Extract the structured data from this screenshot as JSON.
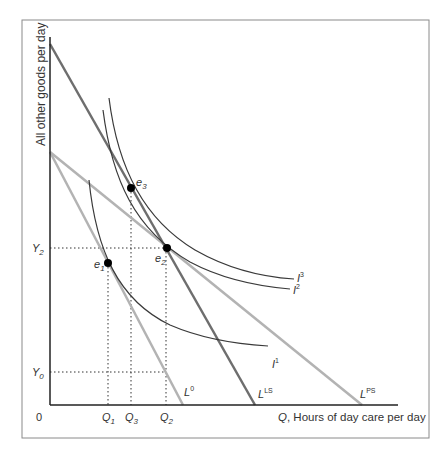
{
  "diagram": {
    "type": "indifference-curve budget-line diagram",
    "y_axis_label": "All other goods per day",
    "x_axis_label_var": "Q",
    "x_axis_label_rest": ", Hours of day care per day",
    "origin_label": "0",
    "y_ticks": [
      {
        "base": "Y",
        "sub": "2",
        "y": 248
      },
      {
        "base": "Y",
        "sub": "0",
        "y": 372
      }
    ],
    "x_ticks": [
      {
        "base": "Q",
        "sub": "1",
        "x": 108
      },
      {
        "base": "Q",
        "sub": "3",
        "x": 131
      },
      {
        "base": "Q",
        "sub": "2",
        "x": 166
      }
    ],
    "budget_lines": [
      {
        "base": "L",
        "sup": "0",
        "color": "#b0b0b0",
        "from": [
          50,
          152
        ],
        "to": [
          183,
          405
        ]
      },
      {
        "base": "L",
        "sup": "PS",
        "color": "#b0b0b0",
        "from": [
          50,
          152
        ],
        "to": [
          362,
          405
        ]
      },
      {
        "base": "L",
        "sup": "LS",
        "color": "#707070",
        "from": [
          50,
          44
        ],
        "to": [
          255,
          405
        ]
      }
    ],
    "indifference_curves": [
      {
        "base": "I",
        "sup": "1"
      },
      {
        "base": "I",
        "sup": "2"
      },
      {
        "base": "I",
        "sup": "3"
      }
    ],
    "equilibria": [
      {
        "base": "e",
        "sub": "1",
        "x": 108,
        "y": 263
      },
      {
        "base": "e",
        "sub": "2",
        "x": 167,
        "y": 248
      },
      {
        "base": "e",
        "sub": "3",
        "x": 131,
        "y": 188
      }
    ],
    "colors": {
      "axis": "#222222",
      "frame": "#8a8a8a",
      "light_line": "#b3b3b3",
      "dark_line": "#6e6e6e",
      "curve": "#3a3a3a",
      "point": "#000000"
    }
  }
}
